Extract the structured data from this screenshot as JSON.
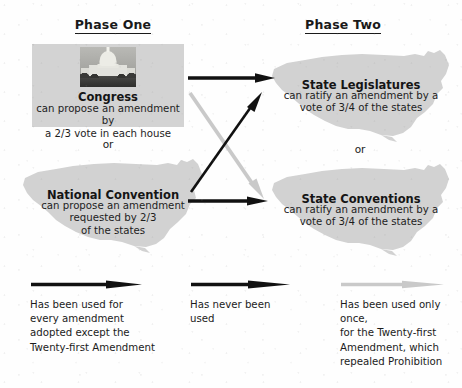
{
  "diagram": {
    "colors": {
      "panel_grey": "#d3d3d3",
      "map_grey": "#d0d0d0",
      "arrow_black": "#111111",
      "arrow_light": "#c9c9c9",
      "text": "#1a1a1a"
    }
  },
  "phases": {
    "one": "Phase One",
    "two": "Phase Two"
  },
  "nodes": {
    "congress": {
      "title": "Congress",
      "line1": "can propose an amendment by",
      "line2": "a 2/3 vote in each house",
      "image_name": "us-capitol-photo"
    },
    "national_convention": {
      "title": "National Convention",
      "line1": "can propose an amendment",
      "line2": "requested by 2/3",
      "line3": "of the states"
    },
    "state_legislatures": {
      "title": "State Legislatures",
      "line1": "can ratify an amendment by a",
      "line2": "vote of 3/4 of the states"
    },
    "state_conventions": {
      "title": "State Conventions",
      "line1": "can ratify an amendment by a",
      "line2": "vote of 3/4 of the states"
    }
  },
  "connectors": {
    "or_left": "or",
    "or_right": "or",
    "arrows": [
      {
        "name": "congress-to-state-legislatures",
        "style": "black",
        "meaning": "Has been used for every amendment adopted except the Twenty-first Amendment"
      },
      {
        "name": "congress-to-state-conventions",
        "style": "light-grey",
        "meaning": "Has been used only once, for the Twenty-first Amendment, which repealed Prohibition"
      },
      {
        "name": "national-convention-to-state-legislatures",
        "style": "black",
        "meaning": "Has never been used"
      },
      {
        "name": "national-convention-to-state-conventions",
        "style": "black",
        "meaning": "Has never been used"
      }
    ]
  },
  "legend": {
    "items": [
      {
        "key": "used-every",
        "arrow_style": "black",
        "lines": [
          "Has been used for",
          "every amendment",
          "adopted except the",
          "Twenty-first Amendment"
        ]
      },
      {
        "key": "never-used",
        "arrow_style": "black",
        "lines": [
          "Has never been",
          "used"
        ]
      },
      {
        "key": "used-once",
        "arrow_style": "light-grey",
        "lines": [
          "Has been used only once,",
          "for the Twenty-first",
          "Amendment, which",
          "repealed Prohibition"
        ]
      }
    ]
  }
}
